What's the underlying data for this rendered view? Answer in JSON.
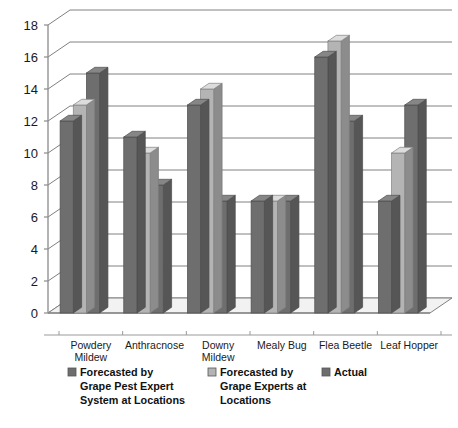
{
  "chart_data": {
    "type": "bar",
    "title": "",
    "subtitle": "",
    "xlabel": "",
    "ylabel": "",
    "ylim": [
      0,
      18
    ],
    "ytick_step": 2,
    "ytick_labels": [
      "0",
      "2",
      "4",
      "6",
      "8",
      "10",
      "12",
      "14",
      "16",
      "18"
    ],
    "grid": true,
    "legend_position": "bottom",
    "style": "3d-clustered-column",
    "categories": [
      "Powdery Mildew",
      "Anthracnose",
      "Downy Mildew",
      "Mealy Bug",
      "Flea Beetle",
      "Leaf Hopper"
    ],
    "category_lines": [
      [
        "Powdery",
        "Mildew"
      ],
      [
        "Anthracnose"
      ],
      [
        "Downy",
        "Mildew"
      ],
      [
        "Mealy Bug"
      ],
      [
        "Flea Beetle"
      ],
      [
        "Leaf Hopper"
      ]
    ],
    "series": [
      {
        "name": "Forecasted by Grape Pest Expert System at Locations",
        "color": "#6e6e6e",
        "values": [
          12,
          11,
          13,
          7,
          16,
          7
        ]
      },
      {
        "name": "Forecasted by Grape Experts at Locations",
        "color": "#b4b4b4",
        "values": [
          13,
          10,
          14,
          7,
          17,
          10
        ]
      },
      {
        "name": "Actual",
        "color": "#6e6e6e",
        "values": [
          15,
          8,
          7,
          7,
          12,
          13
        ]
      }
    ]
  },
  "legend": {
    "entries": [
      {
        "swatch_color": "#6e6e6e",
        "lines": [
          "Forecasted by",
          "Grape Pest Expert",
          "System at Locations"
        ]
      },
      {
        "swatch_color": "#b4b4b4",
        "lines": [
          "Forecasted by",
          "Grape Experts at",
          "Locations"
        ]
      },
      {
        "swatch_color": "#6e6e6e",
        "lines": [
          "Actual"
        ]
      }
    ]
  },
  "colors": {
    "series_dark": "#6e6e6e",
    "series_light": "#b4b4b4",
    "grid": "#808080",
    "axis": "#8a8a8a",
    "text": "#1a1a1a",
    "background": "#ffffff"
  }
}
